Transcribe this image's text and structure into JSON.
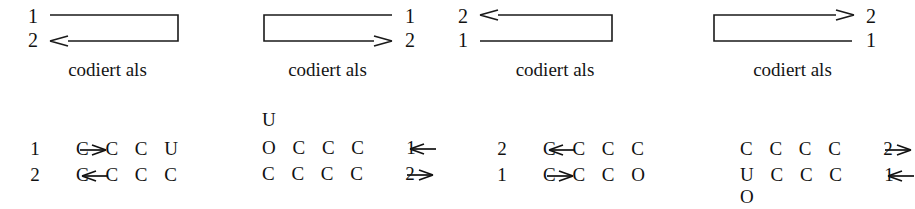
{
  "figure": {
    "caption_label": "codiert als",
    "panels": [
      {
        "id": "panel-1",
        "top_label": "1",
        "bottom_label": "2",
        "label_side": "left",
        "fold_side": "right",
        "arrow_direction": "left",
        "arrow_row": "bottom",
        "code": {
          "overhang_above": "",
          "overhang_below": "",
          "rows": [
            {
              "index": "1",
              "arrow": "right",
              "arrow_side": "left",
              "bases": "C C C U"
            },
            {
              "index": "2",
              "arrow": "left",
              "arrow_side": "left",
              "bases": "C C C C"
            }
          ]
        }
      },
      {
        "id": "panel-2",
        "top_label": "1",
        "bottom_label": "2",
        "label_side": "right",
        "fold_side": "left",
        "arrow_direction": "right",
        "arrow_row": "bottom",
        "code": {
          "overhang_above": "U",
          "overhang_below": "",
          "rows": [
            {
              "index": "1",
              "arrow": "left",
              "arrow_side": "right",
              "bases": "O C C C"
            },
            {
              "index": "2",
              "arrow": "right",
              "arrow_side": "right",
              "bases": "C C C C"
            }
          ]
        }
      },
      {
        "id": "panel-3",
        "top_label": "2",
        "bottom_label": "1",
        "label_side": "left",
        "fold_side": "right",
        "arrow_direction": "left",
        "arrow_row": "top",
        "code": {
          "overhang_above": "",
          "overhang_below": "",
          "rows": [
            {
              "index": "2",
              "arrow": "left",
              "arrow_side": "left",
              "bases": "C C C C"
            },
            {
              "index": "1",
              "arrow": "right",
              "arrow_side": "left",
              "bases": "C C C O"
            }
          ]
        }
      },
      {
        "id": "panel-4",
        "top_label": "2",
        "bottom_label": "1",
        "label_side": "right",
        "fold_side": "left",
        "arrow_direction": "right",
        "arrow_row": "top",
        "code": {
          "overhang_above": "",
          "overhang_below": "O",
          "rows": [
            {
              "index": "2",
              "arrow": "right",
              "arrow_side": "right",
              "bases": "C C C C"
            },
            {
              "index": "1",
              "arrow": "left",
              "arrow_side": "right",
              "bases": "U C C C"
            }
          ]
        }
      }
    ]
  },
  "colors": {
    "ink": "#111111",
    "background": "#ffffff"
  }
}
